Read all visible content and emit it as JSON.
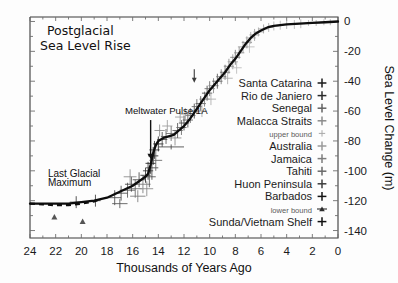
{
  "chart_data": {
    "type": "scatter",
    "title_line1": "Postglacial",
    "title_line2": "Sea Level Rise",
    "xlabel": "Thousands of Years Ago",
    "ylabel": "Sea Level Change (m)",
    "xlim": [
      24,
      0
    ],
    "ylim": [
      -145,
      3
    ],
    "x_ticks": [
      24,
      22,
      20,
      18,
      16,
      14,
      12,
      10,
      8,
      6,
      4,
      2,
      0
    ],
    "x_tick_labels": [
      "24",
      "22",
      "20",
      "18",
      "16",
      "14",
      "12",
      "10",
      "8",
      "6",
      "4",
      "2",
      "0"
    ],
    "y_ticks": [
      0,
      -20,
      -40,
      -60,
      -80,
      -100,
      -120,
      -140
    ],
    "y_tick_labels": [
      "0",
      "-20",
      "-40",
      "-60",
      "-80",
      "-100",
      "-120",
      "-140"
    ],
    "y_minor_step": 10,
    "grid": false,
    "y_axis_side": "right",
    "x_axis_direction": "reversed",
    "legend_position": "right-inside",
    "legend": [
      {
        "label": "Santa Catarina",
        "marker": "plus",
        "color": "#1a1a1a"
      },
      {
        "label": "Rio de Janiero",
        "marker": "plus",
        "color": "#2b2b2b"
      },
      {
        "label": "Senegal",
        "marker": "plus",
        "color": "#626262"
      },
      {
        "label": "Malacca Straits",
        "marker": "plus",
        "color": "#8c8c8c"
      },
      {
        "label": "upper bound",
        "marker": "plus",
        "color": "#a8a8a8",
        "small": true
      },
      {
        "label": "Australia",
        "marker": "plus",
        "color": "#9a9a9a"
      },
      {
        "label": "Jamaica",
        "marker": "plus",
        "color": "#7d7d7d"
      },
      {
        "label": "Tahiti",
        "marker": "plus",
        "color": "#6a6a6a"
      },
      {
        "label": "Huon Peninsula",
        "marker": "plus",
        "color": "#3d3d3d"
      },
      {
        "label": "Barbados",
        "marker": "plus",
        "color": "#141414"
      },
      {
        "label": "lower bound",
        "marker": "triangle",
        "color": "#2e2e2e",
        "small": true
      },
      {
        "label": "Sunda/Vietnam Shelf",
        "marker": "plus",
        "color": "#111111"
      }
    ],
    "annotations": [
      {
        "text": "Meltwater Pulse 1A",
        "x": 16.6,
        "y": -62,
        "arrow_to_x": 14.6,
        "arrow_to_y": -92
      },
      {
        "text": "Last Glacial",
        "x": 22.6,
        "y": -104
      },
      {
        "text": "Maximum",
        "x": 22.6,
        "y": -110
      },
      {
        "text": "",
        "x": 11.2,
        "y": -32,
        "arrow_to_x": 11.2,
        "arrow_to_y": -41
      }
    ],
    "curve": [
      {
        "x": 24.0,
        "y": -122
      },
      {
        "x": 23.0,
        "y": -122
      },
      {
        "x": 22.0,
        "y": -122
      },
      {
        "x": 21.0,
        "y": -122
      },
      {
        "x": 20.0,
        "y": -121
      },
      {
        "x": 19.0,
        "y": -120
      },
      {
        "x": 18.5,
        "y": -119
      },
      {
        "x": 18.0,
        "y": -118
      },
      {
        "x": 17.5,
        "y": -116
      },
      {
        "x": 17.0,
        "y": -114
      },
      {
        "x": 16.5,
        "y": -112
      },
      {
        "x": 16.0,
        "y": -110
      },
      {
        "x": 15.5,
        "y": -107
      },
      {
        "x": 15.0,
        "y": -104
      },
      {
        "x": 14.8,
        "y": -102
      },
      {
        "x": 14.6,
        "y": -96
      },
      {
        "x": 14.4,
        "y": -88
      },
      {
        "x": 14.2,
        "y": -83
      },
      {
        "x": 14.0,
        "y": -80
      },
      {
        "x": 13.6,
        "y": -78
      },
      {
        "x": 13.2,
        "y": -77
      },
      {
        "x": 12.8,
        "y": -76
      },
      {
        "x": 12.4,
        "y": -73
      },
      {
        "x": 12.0,
        "y": -70
      },
      {
        "x": 11.6,
        "y": -66
      },
      {
        "x": 11.2,
        "y": -61
      },
      {
        "x": 10.8,
        "y": -56
      },
      {
        "x": 10.4,
        "y": -51
      },
      {
        "x": 10.0,
        "y": -46
      },
      {
        "x": 9.6,
        "y": -42
      },
      {
        "x": 9.2,
        "y": -38
      },
      {
        "x": 8.8,
        "y": -34
      },
      {
        "x": 8.4,
        "y": -29
      },
      {
        "x": 8.0,
        "y": -25
      },
      {
        "x": 7.6,
        "y": -20
      },
      {
        "x": 7.2,
        "y": -15
      },
      {
        "x": 6.8,
        "y": -11
      },
      {
        "x": 6.4,
        "y": -8
      },
      {
        "x": 6.0,
        "y": -6
      },
      {
        "x": 5.5,
        "y": -4
      },
      {
        "x": 5.0,
        "y": -3
      },
      {
        "x": 4.0,
        "y": -2
      },
      {
        "x": 3.0,
        "y": -1.5
      },
      {
        "x": 2.0,
        "y": -1
      },
      {
        "x": 1.0,
        "y": -0.5
      },
      {
        "x": 0.0,
        "y": 0
      }
    ],
    "curve_dashed": [
      {
        "x": 24.0,
        "y": -122
      },
      {
        "x": 23.0,
        "y": -122.5
      },
      {
        "x": 22.0,
        "y": -123
      },
      {
        "x": 21.0,
        "y": -123
      },
      {
        "x": 20.0,
        "y": -122
      },
      {
        "x": 19.0,
        "y": -120.5
      },
      {
        "x": 18.5,
        "y": -119
      }
    ],
    "points": [
      {
        "x": 22.1,
        "y": -131,
        "ex": 0.0,
        "ey": 0,
        "marker": "triangle",
        "color": "#555"
      },
      {
        "x": 19.9,
        "y": -134,
        "ex": 0.0,
        "ey": 0,
        "marker": "triangle",
        "color": "#555"
      },
      {
        "x": 20.4,
        "y": -121,
        "ex": 0.5,
        "ey": 4,
        "color": "#3a3a3a"
      },
      {
        "x": 18.9,
        "y": -120,
        "ex": 0.4,
        "ey": 4,
        "color": "#3a3a3a"
      },
      {
        "x": 17.4,
        "y": -118,
        "ex": 0.5,
        "ey": 5,
        "color": "#4a4a4a"
      },
      {
        "x": 16.9,
        "y": -115,
        "ex": 0.5,
        "ey": 5,
        "color": "#4a4a4a"
      },
      {
        "x": 16.4,
        "y": -113,
        "ex": 0.6,
        "ey": 5,
        "color": "#555"
      },
      {
        "x": 16.1,
        "y": -109,
        "ex": 0.5,
        "ey": 5,
        "color": "#444"
      },
      {
        "x": 15.8,
        "y": -112,
        "ex": 0.5,
        "ey": 6,
        "color": "#666"
      },
      {
        "x": 15.5,
        "y": -106,
        "ex": 0.5,
        "ey": 5,
        "color": "#444"
      },
      {
        "x": 15.2,
        "y": -109,
        "ex": 0.6,
        "ey": 6,
        "color": "#777"
      },
      {
        "x": 15.0,
        "y": -103,
        "ex": 0.4,
        "ey": 5,
        "color": "#333"
      },
      {
        "x": 14.8,
        "y": -100,
        "ex": 0.4,
        "ey": 6,
        "color": "#333"
      },
      {
        "x": 14.7,
        "y": -104,
        "ex": 0.5,
        "ey": 7,
        "color": "#555"
      },
      {
        "x": 14.6,
        "y": -95,
        "ex": 0.4,
        "ey": 7,
        "color": "#222"
      },
      {
        "x": 14.5,
        "y": -98,
        "ex": 0.5,
        "ey": 8,
        "color": "#444"
      },
      {
        "x": 14.4,
        "y": -90,
        "ex": 0.4,
        "ey": 6,
        "color": "#222"
      },
      {
        "x": 14.3,
        "y": -86,
        "ex": 0.4,
        "ey": 6,
        "color": "#333"
      },
      {
        "x": 14.2,
        "y": -93,
        "ex": 0.5,
        "ey": 7,
        "color": "#666"
      },
      {
        "x": 14.0,
        "y": -82,
        "ex": 0.4,
        "ey": 5,
        "color": "#222"
      },
      {
        "x": 13.7,
        "y": -79,
        "ex": 0.4,
        "ey": 5,
        "color": "#444"
      },
      {
        "x": 13.4,
        "y": -77,
        "ex": 0.4,
        "ey": 5,
        "color": "#555"
      },
      {
        "x": 13.0,
        "y": -75,
        "ex": 0.4,
        "ey": 5,
        "color": "#666"
      },
      {
        "x": 12.7,
        "y": -78,
        "ex": 0.5,
        "ey": 5,
        "color": "#888"
      },
      {
        "x": 12.5,
        "y": -73,
        "ex": 0.4,
        "ey": 5,
        "color": "#555"
      },
      {
        "x": 12.2,
        "y": -71,
        "ex": 0.4,
        "ey": 5,
        "color": "#666"
      },
      {
        "x": 12.0,
        "y": -68,
        "ex": 0.4,
        "ey": 5,
        "color": "#444"
      },
      {
        "x": 11.7,
        "y": -66,
        "ex": 0.4,
        "ey": 5,
        "color": "#555"
      },
      {
        "x": 11.5,
        "y": -63,
        "ex": 0.4,
        "ey": 5,
        "color": "#777"
      },
      {
        "x": 11.2,
        "y": -60,
        "ex": 0.4,
        "ey": 5,
        "color": "#444"
      },
      {
        "x": 11.0,
        "y": -57,
        "ex": 0.4,
        "ey": 5,
        "color": "#666"
      },
      {
        "x": 10.7,
        "y": -55,
        "ex": 0.4,
        "ey": 5,
        "color": "#555"
      },
      {
        "x": 10.4,
        "y": -52,
        "ex": 0.4,
        "ey": 5,
        "color": "#777"
      },
      {
        "x": 10.2,
        "y": -48,
        "ex": 0.4,
        "ey": 5,
        "color": "#444"
      },
      {
        "x": 10.0,
        "y": -45,
        "ex": 0.4,
        "ey": 5,
        "color": "#666"
      },
      {
        "x": 9.7,
        "y": -43,
        "ex": 0.4,
        "ey": 5,
        "color": "#888"
      },
      {
        "x": 9.4,
        "y": -40,
        "ex": 0.4,
        "ey": 5,
        "color": "#555"
      },
      {
        "x": 9.1,
        "y": -37,
        "ex": 0.4,
        "ey": 5,
        "color": "#777"
      },
      {
        "x": 8.8,
        "y": -34,
        "ex": 0.4,
        "ey": 5,
        "color": "#666"
      },
      {
        "x": 8.5,
        "y": -30,
        "ex": 0.4,
        "ey": 5,
        "color": "#888"
      },
      {
        "x": 8.2,
        "y": -27,
        "ex": 0.4,
        "ey": 5,
        "color": "#999"
      },
      {
        "x": 8.0,
        "y": -24,
        "ex": 0.4,
        "ey": 5,
        "color": "#777"
      },
      {
        "x": 7.7,
        "y": -21,
        "ex": 0.4,
        "ey": 4,
        "color": "#888"
      },
      {
        "x": 7.4,
        "y": -17,
        "ex": 0.4,
        "ey": 4,
        "color": "#999"
      },
      {
        "x": 7.1,
        "y": -14,
        "ex": 0.4,
        "ey": 4,
        "color": "#888"
      },
      {
        "x": 6.8,
        "y": -11,
        "ex": 0.4,
        "ey": 4,
        "color": "#aaa"
      },
      {
        "x": 6.5,
        "y": -9,
        "ex": 0.4,
        "ey": 4,
        "color": "#999"
      },
      {
        "x": 6.2,
        "y": -7,
        "ex": 0.4,
        "ey": 3,
        "color": "#aaa"
      },
      {
        "x": 5.8,
        "y": -5,
        "ex": 0.4,
        "ey": 3,
        "color": "#999"
      },
      {
        "x": 5.4,
        "y": -4,
        "ex": 0.4,
        "ey": 3,
        "color": "#aaa"
      },
      {
        "x": 5.0,
        "y": -3,
        "ex": 0.4,
        "ey": 3,
        "color": "#b0b0b0"
      },
      {
        "x": 4.5,
        "y": -2.5,
        "ex": 0.3,
        "ey": 3,
        "color": "#b5b5b5"
      },
      {
        "x": 4.0,
        "y": -2,
        "ex": 0.3,
        "ey": 3,
        "color": "#aaa"
      },
      {
        "x": 3.4,
        "y": -2,
        "ex": 0.3,
        "ey": 3,
        "color": "#b5b5b5"
      },
      {
        "x": 2.9,
        "y": -1.5,
        "ex": 0.3,
        "ey": 3,
        "color": "#b0b0b0"
      },
      {
        "x": 2.3,
        "y": -1,
        "ex": 0.3,
        "ey": 2,
        "color": "#b5b5b5"
      },
      {
        "x": 1.7,
        "y": -1,
        "ex": 0.3,
        "ey": 2,
        "color": "#aaa"
      },
      {
        "x": 1.1,
        "y": -0.5,
        "ex": 0.3,
        "ey": 2,
        "color": "#b5b5b5"
      },
      {
        "x": 0.6,
        "y": -0.5,
        "ex": 0.3,
        "ey": 2,
        "color": "#aaa"
      },
      {
        "x": 13.0,
        "y": -84,
        "ex": 1.0,
        "ey": 1,
        "color": "#444"
      },
      {
        "x": 17.0,
        "y": -122,
        "ex": 0.6,
        "ey": 3,
        "color": "#555"
      },
      {
        "x": 15.6,
        "y": -117,
        "ex": 0.6,
        "ey": 4,
        "color": "#777"
      },
      {
        "x": 14.9,
        "y": -112,
        "ex": 0.5,
        "ey": 5,
        "color": "#888"
      },
      {
        "x": 12.3,
        "y": -64,
        "ex": 0.4,
        "ey": 4,
        "color": "#999"
      },
      {
        "x": 11.9,
        "y": -62,
        "ex": 0.4,
        "ey": 4,
        "color": "#999"
      },
      {
        "x": 9.9,
        "y": -52,
        "ex": 0.4,
        "ey": 4,
        "color": "#aaa"
      },
      {
        "x": 10.6,
        "y": -60,
        "ex": 0.4,
        "ey": 4,
        "color": "#aaa"
      },
      {
        "x": 8.6,
        "y": -38,
        "ex": 0.4,
        "ey": 4,
        "color": "#aaa"
      },
      {
        "x": 7.9,
        "y": -31,
        "ex": 0.4,
        "ey": 4,
        "color": "#bbb"
      },
      {
        "x": 6.9,
        "y": -17,
        "ex": 0.4,
        "ey": 4,
        "color": "#bbb"
      },
      {
        "x": 13.9,
        "y": -73,
        "ex": 0.4,
        "ey": 4,
        "color": "#888"
      },
      {
        "x": 13.3,
        "y": -70,
        "ex": 0.4,
        "ey": 4,
        "color": "#999"
      },
      {
        "x": 16.2,
        "y": -104,
        "ex": 0.5,
        "ey": 5,
        "color": "#888"
      }
    ]
  }
}
